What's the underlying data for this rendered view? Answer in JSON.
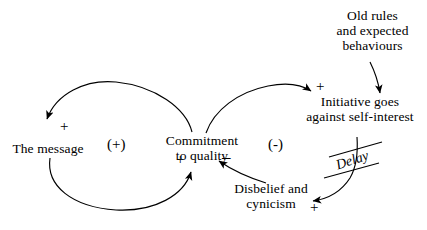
{
  "diagram": {
    "type": "causal-loop-diagram",
    "title": "",
    "background_color": "#ffffff",
    "stroke_color": "#000000",
    "nodes": [
      {
        "id": "the-message",
        "label": "The message",
        "x": 48,
        "y": 148
      },
      {
        "id": "commitment-to-quality",
        "label": "Commitment\nto quality",
        "x": 202,
        "y": 140
      },
      {
        "id": "initiative-against-self-interest",
        "label": "Initiative goes\nagainst self-interest",
        "x": 355,
        "y": 110
      },
      {
        "id": "old-rules",
        "label": "Old rules\nand expected\nbehaviours",
        "x": 375,
        "y": 25
      },
      {
        "id": "disbelief-and-cynicism",
        "label": "Disbelief and\ncynicism",
        "x": 272,
        "y": 190
      }
    ],
    "links": [
      {
        "id": "commitment-to-message",
        "from": "commitment-to-quality",
        "to": "the-message",
        "polarity": "+",
        "polarity_x": 44,
        "polarity_y": 124
      },
      {
        "id": "message-to-commitment",
        "from": "the-message",
        "to": "commitment-to-quality",
        "polarity": "+",
        "polarity_x": 176,
        "polarity_y": 156
      },
      {
        "id": "commitment-to-initiative",
        "from": "commitment-to-quality",
        "to": "initiative-against-self-interest",
        "polarity": "+",
        "polarity_x": 313,
        "polarity_y": 79
      },
      {
        "id": "initiative-to-disbelief",
        "from": "initiative-against-self-interest",
        "to": "disbelief-and-cynicism",
        "polarity": "+",
        "polarity_x": 311,
        "polarity_y": 202,
        "delay": "Delay"
      },
      {
        "id": "disbelief-to-commitment",
        "from": "disbelief-and-cynicism",
        "to": "commitment-to-quality",
        "polarity": "–",
        "polarity_x": 220,
        "polarity_y": 155
      },
      {
        "id": "oldrules-to-initiative",
        "from": "old-rules",
        "to": "initiative-against-self-interest",
        "polarity": ""
      }
    ],
    "loops": [
      {
        "id": "reinforcing-loop",
        "label": "(+)",
        "x": 107,
        "y": 138
      },
      {
        "id": "balancing-loop",
        "label": "(-)",
        "x": 268,
        "y": 138
      }
    ],
    "delay_marker": {
      "label": "Delay",
      "x": 337,
      "y": 164
    }
  }
}
